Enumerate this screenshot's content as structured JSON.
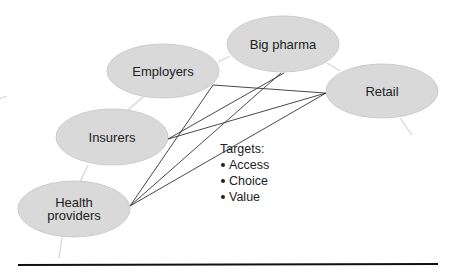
{
  "diagram": {
    "nodes": [
      {
        "id": "employers",
        "label": "Employers",
        "cx": 163,
        "cy": 71,
        "rx": 56,
        "ry": 27
      },
      {
        "id": "big_pharma",
        "label": "Big pharma",
        "cx": 283,
        "cy": 44,
        "rx": 56,
        "ry": 28
      },
      {
        "id": "retail",
        "label": "Retail",
        "cx": 382,
        "cy": 91,
        "rx": 56,
        "ry": 27
      },
      {
        "id": "insurers",
        "label": "Insurers",
        "cx": 112,
        "cy": 137,
        "rx": 56,
        "ry": 28
      },
      {
        "id": "health_providers",
        "label_line1": "Health",
        "label_line2": "providers",
        "cx": 74,
        "cy": 209,
        "rx": 56,
        "ry": 28
      }
    ],
    "targets": {
      "title": "Targets:",
      "items": [
        "Access",
        "Choice",
        "Value"
      ]
    },
    "colors": {
      "node_fill": "#d9d9d9",
      "node_stroke": "#c8c8c8",
      "link": "#333333",
      "faint_link": "#d8d8d8",
      "rule": "#111111"
    }
  }
}
